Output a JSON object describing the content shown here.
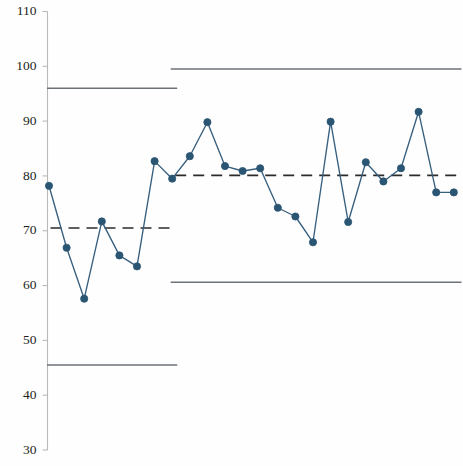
{
  "chart_data": {
    "type": "line",
    "title": "",
    "subtitle": "",
    "xlabel": "",
    "ylabel": "",
    "ylim": [
      30,
      110
    ],
    "ytick_labels": [
      "110",
      "100",
      "90",
      "80",
      "70",
      "60",
      "50",
      "40",
      "30"
    ],
    "yticks": [
      110,
      100,
      90,
      80,
      70,
      60,
      50,
      40,
      30
    ],
    "xlim": [
      0,
      25
    ],
    "grid": false,
    "legend": null,
    "series": [
      {
        "name": "Individual measurement",
        "marker": "filled-circle",
        "color": "#2a5573",
        "x": [
          1,
          2,
          3,
          4,
          5,
          6,
          7,
          8,
          9,
          10,
          11,
          12,
          13,
          14,
          15,
          16,
          17,
          18,
          19,
          20,
          21,
          22,
          23,
          24
        ],
        "values": [
          78.2,
          66.9,
          57.6,
          71.7,
          65.5,
          63.5,
          82.7,
          79.5,
          83.6,
          89.8,
          81.8,
          80.9,
          81.4,
          74.2,
          72.6,
          67.9,
          89.9,
          71.6,
          82.5,
          79.0,
          81.4,
          91.7,
          77.0,
          77.0
        ]
      }
    ],
    "annotations": {
      "stage_break_x": 8,
      "phases": [
        {
          "name": "Phase 1",
          "x_start": 1,
          "x_end": 8,
          "center_line": 70.5,
          "upper_control_limit": 96.0,
          "lower_control_limit": 45.5
        },
        {
          "name": "Phase 2",
          "x_start": 8,
          "x_end": 25,
          "center_line": 80.1,
          "upper_control_limit": 99.5,
          "lower_control_limit": 60.6
        }
      ]
    },
    "line_styles": {
      "control_limit": "solid",
      "center_line": "dashed",
      "series": "solid"
    },
    "colors": {
      "series": "#2a5573",
      "series_line": "#375f7e",
      "control_limit": "#6d7278",
      "center_line": "#2b2b2b",
      "axis": "#b9b9b9",
      "tick_text": "#231f20",
      "background": "#fefefe"
    }
  }
}
